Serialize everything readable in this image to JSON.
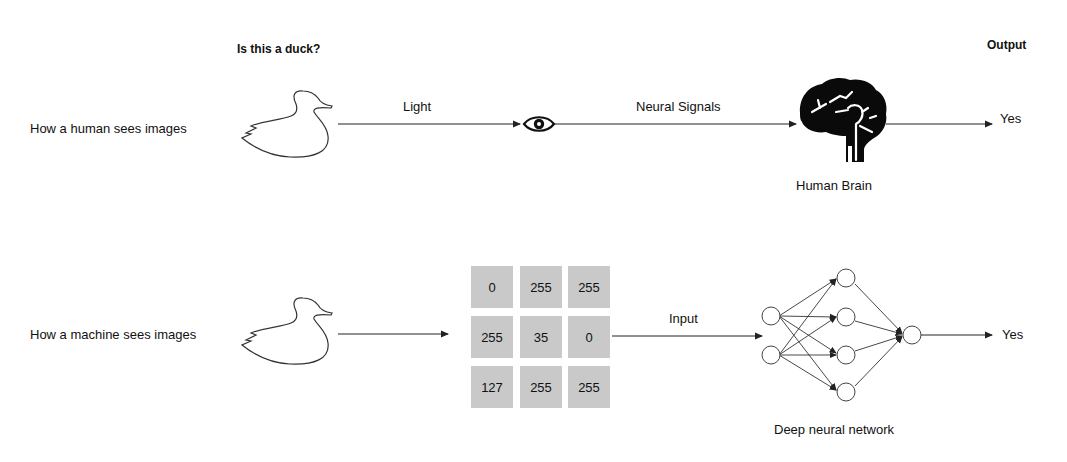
{
  "headers": {
    "question": "Is this a duck?",
    "output": "Output"
  },
  "human_row": {
    "label": "How a human sees images",
    "edge1_label": "Light",
    "edge2_label": "Neural Signals",
    "eye_icon": "eye-icon",
    "brain_icon": "brain-icon",
    "brain_label": "Human Brain",
    "result": "Yes"
  },
  "machine_row": {
    "label": "How a machine sees images",
    "pixel_grid": [
      [
        "0",
        "255",
        "255"
      ],
      [
        "255",
        "35",
        "0"
      ],
      [
        "127",
        "255",
        "255"
      ]
    ],
    "edge_label": "Input",
    "network_label": "Deep neural network",
    "network_layers": [
      2,
      4,
      1
    ],
    "result": "Yes"
  },
  "colors": {
    "line": "#222222",
    "cell_bg": "#c9c9c9"
  }
}
